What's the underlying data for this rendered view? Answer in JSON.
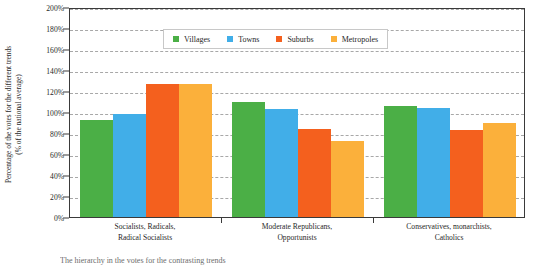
{
  "chart_data": {
    "type": "bar",
    "title": "",
    "xlabel": "",
    "ylabel_lines": [
      "Percentage of the votes for the different trends",
      "(% of the national average)"
    ],
    "ylabel": "Percentage of the votes for the different trends (% of the national average)",
    "categories": [
      [
        "Socialists, Radicals,",
        "Radical Socialists"
      ],
      [
        "Moderate Republicans,",
        "Opportunists"
      ],
      [
        "Conservatives, monarchists,",
        "Catholics"
      ]
    ],
    "category_names": [
      "Socialists, Radicals, Radical Socialists",
      "Moderate Republicans, Opportunists",
      "Conservatives, monarchists, Catholics"
    ],
    "series": [
      {
        "name": "Villages",
        "color": "#4BAF46",
        "values": [
          92,
          110,
          106
        ]
      },
      {
        "name": "Towns",
        "color": "#41AEE8",
        "values": [
          98,
          103,
          104
        ]
      },
      {
        "name": "Suburbs",
        "color": "#F4601E",
        "values": [
          127,
          84,
          83
        ]
      },
      {
        "name": "Metropoles",
        "color": "#FBB03B",
        "values": [
          127,
          72,
          90
        ]
      }
    ],
    "ylim": [
      0,
      200
    ],
    "ytick_step": 20,
    "yticks": [
      "0%",
      "20%",
      "40%",
      "60%",
      "80%",
      "100%",
      "120%",
      "140%",
      "160%",
      "180%",
      "200%"
    ],
    "grid": true,
    "legend_position": "top-center",
    "caption": "The hierarchy in the votes for the contrasting trends"
  },
  "colors": {
    "axis": "#3a3a3a",
    "grid": "#9a9a9a",
    "text": "#1f1f1f",
    "background": "#ffffff"
  }
}
